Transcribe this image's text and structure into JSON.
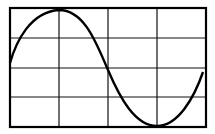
{
  "diagram": {
    "type": "oscilloscope-sine-wave",
    "grid": {
      "columns": 4,
      "rows": 4
    },
    "waveform": "sine",
    "colors": {
      "background": "#ffffff",
      "lines": "#000000"
    }
  }
}
